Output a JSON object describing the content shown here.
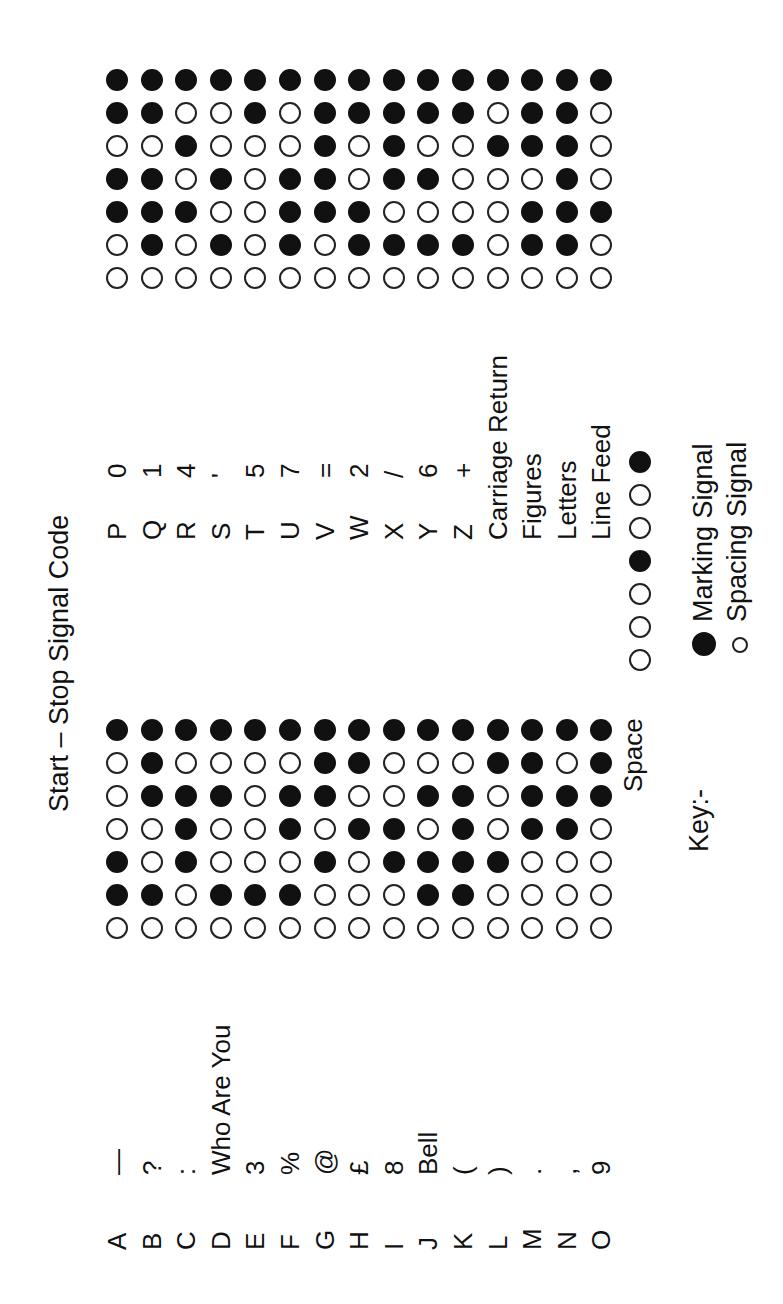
{
  "title": "Start – Stop Signal Code",
  "signal_order_note": "Each code: start pulse, 5 code pulses, stop pulse",
  "grid_left": {
    "rows": [
      {
        "letter": "A",
        "figure": "—",
        "code": [
          0,
          1,
          1,
          0,
          0,
          0,
          1
        ]
      },
      {
        "letter": "B",
        "figure": "?",
        "code": [
          0,
          1,
          0,
          0,
          1,
          1,
          1
        ]
      },
      {
        "letter": "C",
        "figure": ":",
        "code": [
          0,
          0,
          1,
          1,
          1,
          0,
          1
        ]
      },
      {
        "letter": "D",
        "figure": "Who Are You",
        "code": [
          0,
          1,
          0,
          0,
          1,
          0,
          1
        ]
      },
      {
        "letter": "E",
        "figure": "3",
        "code": [
          0,
          1,
          0,
          0,
          0,
          0,
          1
        ]
      },
      {
        "letter": "F",
        "figure": "%",
        "code": [
          0,
          1,
          0,
          1,
          1,
          0,
          1
        ]
      },
      {
        "letter": "G",
        "figure": "@",
        "code": [
          0,
          0,
          1,
          0,
          1,
          1,
          1
        ]
      },
      {
        "letter": "H",
        "figure": "£",
        "code": [
          0,
          0,
          0,
          1,
          0,
          1,
          1
        ]
      },
      {
        "letter": "I",
        "figure": "8",
        "code": [
          0,
          0,
          1,
          1,
          0,
          0,
          1
        ]
      },
      {
        "letter": "J",
        "figure": "Bell",
        "code": [
          0,
          1,
          1,
          0,
          1,
          0,
          1
        ]
      },
      {
        "letter": "K",
        "figure": "(",
        "code": [
          0,
          1,
          1,
          1,
          1,
          0,
          1
        ]
      },
      {
        "letter": "L",
        "figure": ")",
        "code": [
          0,
          0,
          1,
          0,
          0,
          1,
          1
        ]
      },
      {
        "letter": "M",
        "figure": ".",
        "code": [
          0,
          0,
          0,
          1,
          1,
          1,
          1
        ]
      },
      {
        "letter": "N",
        "figure": ",",
        "code": [
          0,
          0,
          0,
          1,
          1,
          0,
          1
        ]
      },
      {
        "letter": "O",
        "figure": "9",
        "code": [
          0,
          0,
          0,
          0,
          1,
          1,
          1
        ]
      }
    ]
  },
  "grid_right": {
    "rows": [
      {
        "letter": "P",
        "figure": "0",
        "code": [
          0,
          0,
          1,
          1,
          0,
          1,
          1
        ]
      },
      {
        "letter": "Q",
        "figure": "1",
        "code": [
          0,
          1,
          1,
          1,
          0,
          1,
          1
        ]
      },
      {
        "letter": "R",
        "figure": "4",
        "code": [
          0,
          0,
          1,
          0,
          1,
          0,
          1
        ]
      },
      {
        "letter": "S",
        "figure": "'",
        "code": [
          0,
          1,
          0,
          1,
          0,
          0,
          1
        ]
      },
      {
        "letter": "T",
        "figure": "5",
        "code": [
          0,
          0,
          0,
          0,
          0,
          1,
          1
        ]
      },
      {
        "letter": "U",
        "figure": "7",
        "code": [
          0,
          1,
          1,
          1,
          0,
          0,
          1
        ]
      },
      {
        "letter": "V",
        "figure": "=",
        "code": [
          0,
          0,
          1,
          1,
          1,
          1,
          1
        ]
      },
      {
        "letter": "W",
        "figure": "2",
        "code": [
          0,
          1,
          1,
          0,
          0,
          1,
          1
        ]
      },
      {
        "letter": "X",
        "figure": "/",
        "code": [
          0,
          1,
          0,
          1,
          1,
          1,
          1
        ]
      },
      {
        "letter": "Y",
        "figure": "6",
        "code": [
          0,
          1,
          0,
          1,
          0,
          1,
          1
        ]
      },
      {
        "letter": "Z",
        "figure": "+",
        "code": [
          0,
          1,
          0,
          0,
          0,
          1,
          1
        ]
      },
      {
        "letter": "Carriage Return",
        "figure": "",
        "code": [
          0,
          0,
          0,
          0,
          1,
          0,
          1
        ]
      },
      {
        "letter": "Figures",
        "figure": "",
        "code": [
          0,
          1,
          1,
          0,
          1,
          1,
          1
        ]
      },
      {
        "letter": "Letters",
        "figure": "",
        "code": [
          0,
          1,
          1,
          1,
          1,
          1,
          1
        ]
      },
      {
        "letter": "Line Feed",
        "figure": "",
        "code": [
          0,
          0,
          1,
          0,
          0,
          0,
          1
        ]
      }
    ]
  },
  "space_row": {
    "label": "Space",
    "code": [
      0,
      0,
      0,
      1,
      0,
      0,
      1
    ]
  },
  "key": {
    "title": "Key:-",
    "marking_label": "Marking Signal",
    "spacing_label": "Spacing Signal",
    "marking_icon": "filled-circle-icon",
    "spacing_icon": "open-circle-icon"
  },
  "colors": {
    "ink": "#111111",
    "paper": "#ffffff"
  }
}
